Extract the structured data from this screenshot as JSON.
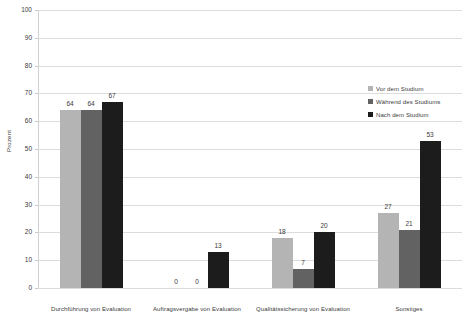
{
  "chart_data": {
    "type": "bar",
    "title": "",
    "xlabel": "",
    "ylabel": "Prozent",
    "ylim": [
      0,
      100
    ],
    "ytick_step": 10,
    "yticks": [
      100,
      90,
      80,
      70,
      60,
      50,
      40,
      30,
      20,
      10,
      0
    ],
    "grid": true,
    "legend_position": "upper right",
    "categories": [
      "Durchführung von Evaluation",
      "Auftragsvergabe von Evaluation",
      "Qualitätssicherung von Evaluation",
      "Sonstiges"
    ],
    "series": [
      {
        "name": "Vor dem Studium",
        "color": "#b4b4b4",
        "values": [
          64,
          0,
          18,
          27
        ]
      },
      {
        "name": "Während des Studiums",
        "color": "#626262",
        "values": [
          64,
          0,
          7,
          21
        ]
      },
      {
        "name": "Nach dem Studium",
        "color": "#1c1c1c",
        "values": [
          67,
          13,
          20,
          53
        ]
      }
    ]
  },
  "colors": {
    "background": "#ffffff",
    "gridline": "#dcdcdc",
    "axis": "#d0d0d0",
    "text": "#3a3a3a"
  }
}
